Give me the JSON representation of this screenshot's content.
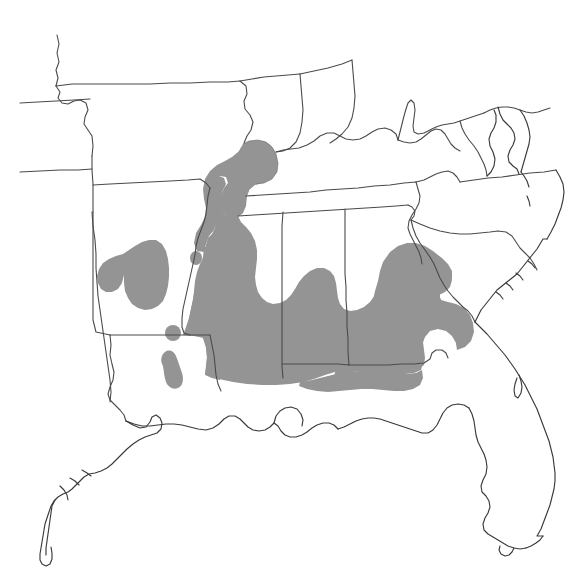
{
  "figure": {
    "type": "species-range-map",
    "title": "",
    "region_label": "Southeastern United States",
    "background_color": "#ffffff",
    "range_fill_color": "#949494",
    "border_line_color": "#4a4a4a",
    "coastline_color": "#3a3a3a",
    "width_px": 577,
    "height_px": 582
  },
  "legend": {
    "present": false,
    "items": [
      {
        "label": "Range",
        "color": "#949494"
      }
    ]
  },
  "map_data": {
    "projection_hint": "equirectangular-approx",
    "states_outlined": [
      "Kansas",
      "Missouri",
      "Illinois",
      "Indiana",
      "Kentucky",
      "Ohio",
      "West Virginia",
      "Virginia",
      "Maryland",
      "Delaware",
      "Oklahoma",
      "Arkansas",
      "Tennessee",
      "North Carolina",
      "Texas",
      "Louisiana",
      "Mississippi",
      "Alabama",
      "Georgia",
      "South Carolina",
      "Florida"
    ],
    "range_regions": [
      {
        "name": "mississippi-embayment",
        "states": [
          "Illinois",
          "Kentucky",
          "Missouri",
          "Arkansas",
          "Tennessee",
          "Mississippi",
          "Louisiana"
        ]
      },
      {
        "name": "gulf-coastal-plain",
        "states": [
          "Mississippi",
          "Alabama",
          "Louisiana",
          "Florida"
        ]
      },
      {
        "name": "ouachita-ozark-patch",
        "states": [
          "Oklahoma",
          "Arkansas"
        ]
      },
      {
        "name": "atlantic-coastal-plain",
        "states": [
          "Georgia",
          "South Carolina"
        ]
      },
      {
        "name": "louisiana-isolate-north",
        "states": [
          "Louisiana"
        ]
      },
      {
        "name": "louisiana-isolate-south",
        "states": [
          "Louisiana"
        ]
      },
      {
        "name": "arkansas-isolate",
        "states": [
          "Arkansas"
        ]
      }
    ],
    "water_bodies": [
      "Gulf of Mexico",
      "Atlantic Ocean",
      "Chesapeake Bay"
    ],
    "annotations": []
  }
}
